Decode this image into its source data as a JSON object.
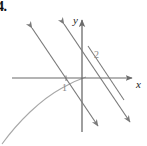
{
  "figure": {
    "exercise_number": "4.",
    "background_color": "#ffffff",
    "axis_color": "#6b6b6b",
    "line_color": "#7a7a7a",
    "curve_color": "#a0a0a0",
    "label_color": "#8a8a8a",
    "axes": {
      "x_label": "x",
      "y_label": "y",
      "origin": {
        "x": 82,
        "y": 78
      },
      "x_axis": {
        "x1": 12,
        "y1": 78,
        "x2": 134,
        "y2": 78
      },
      "y_axis": {
        "x1": 82,
        "y1": 130,
        "x2": 82,
        "y2": 18
      }
    },
    "labels": [
      {
        "name": "label-1",
        "text": "1",
        "x": 63,
        "y": 89
      },
      {
        "name": "label-2",
        "text": "2",
        "x": 95,
        "y": 57
      }
    ],
    "lines": [
      {
        "name": "line-left",
        "x1": 30,
        "y1": 26,
        "x2": 100,
        "y2": 128,
        "arrow_start": true,
        "arrow_end": true
      },
      {
        "name": "line-middle",
        "x1": 62,
        "y1": 22,
        "x2": 132,
        "y2": 124,
        "arrow_start": true,
        "arrow_end": true
      },
      {
        "name": "line-right",
        "x1": 86,
        "y1": 44,
        "x2": 126,
        "y2": 102,
        "arrow_start": false,
        "arrow_end": false
      }
    ],
    "curve": {
      "name": "parabola-curve",
      "description": "concave-down curve rising from lower-left",
      "path": "M 2 144 C 18 122, 40 100, 62 88 C 72 82, 80 79, 86 77"
    }
  }
}
